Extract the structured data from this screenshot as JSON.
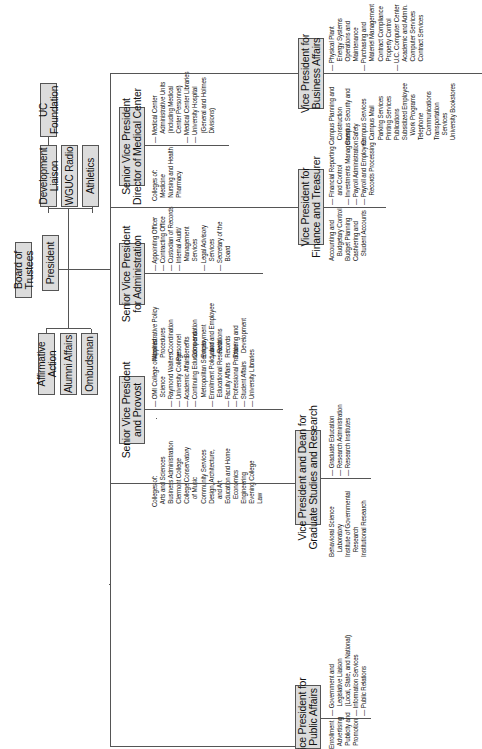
{
  "chart_title": "",
  "top": {
    "board": "Board of Trustees",
    "president": "President",
    "uc_foundation": "UC Foundation",
    "staff_upper": [
      "Development Liaison",
      "WGUC Radio",
      "Athletics"
    ],
    "staff_lower": [
      "Affirmative Action",
      "Alumni Affairs",
      "Ombudsman"
    ]
  },
  "senior_vps": [
    {
      "title": "Senior Vice President\nand Provost",
      "left_list": "Colleges of:\n  Arts and Sciences\n  Business Administration\n  Clermont College\n  College Conservatory\n     of Music\n  Community Services\n  Design, Architecture,\n     and Art\n  Education and Home\n     Economics\n  Engineering\n  Evening College\n  Law",
      "right_list": "— OMI College of Applied\n      Science\n— Raymond Walters\n— University College\n— Academic Affairs\n— Continuing Education and\n      Metropolitan Services\n— Enrollment Policy and\n      Educational Research\n— Faculty Affairs\n— Professional Practice\n— Student Affairs\n— University Libraries"
    },
    {
      "title": "Senior Vice President\nfor Administration",
      "left_list": "Administrative Policy\n  Procedures\n     Coordination\nPersonnel\n  Benefits\n  Compensation\n  Employment\n  Labor and Employee\n     Relations\n  Records\n  Training and\n     Development",
      "right_list": "— Appointing Officer\n— Contracting Office\n— Custodian of Records\n— Internal Audit/\n      Management\n      Services\n— Legal Advisory\n      Services\n— Secretary of the\n      Board"
    },
    {
      "title": "Senior Vice President\nDirector of Medical Center",
      "left_list": "Colleges of:\n  Medicine\n  Nursing and Health\n  Pharmacy",
      "right_list": "— Medical Center\n      Administrative Units\n      (including Medical\n      Center Personnel)\n— Medical Center Libraries\n— University Hospital\n      (General and Holmes\n      Divisions)"
    }
  ],
  "vps": [
    {
      "title": "Vice President for\nPublic Affairs",
      "left_list": "Enrollment\n  Advertising\n  Publicity and\n  Promotion",
      "right_list": "— Government and\n      Legislative Liaison\n      (Local, State, and National)\n— Information Services\n— Public Relations"
    },
    {
      "title": "Vice President and Dean for\nGraduate Studies and Research",
      "left_list": "Behavioral Science\n   Laboratory\nInstitute of Governmental\n   Research\nInstitutional Research",
      "right_list": "— Graduate Education\n— Research Administration\n— Research Institutes"
    },
    {
      "title": "Vice President for\nFinance and Treasurer",
      "left_list": "Accounting and\n   Budgetary Control\nBudget Planning\nCashiering and\n   Student Accounts",
      "right_list": "— Financial Reporting\n      and Control\n— Investments Management\n— Payroll Administration\n— Payroll and Employee\n      Records Processing"
    },
    {
      "title": "Vice President for\nBusiness Affairs",
      "left_list": "Campus Planning and\n   Construction\nCampus Security and\n   Safety\nCampus Services\n   Campus Mail\n   Parking Services\n   Printing Services\n   Publications\n   Subsidized Employee\n      Work Programs\n   Telephone\n      Communications\n   Transportation\n      Services\n   University Bookstores",
      "right_list": "— Physical Plant\n      Energy Systems\n      Operations and\n      Maintenance\n— Purchasing and\n      Materiel Management\n      Contract Compliance\n      Property Control\n— U.C. Computer Center\n      Academic and Admin.\n      Computer Services\n      Contract Services"
    }
  ],
  "colors": {
    "box_fill": "#dcdcdc",
    "line": "#555555"
  }
}
